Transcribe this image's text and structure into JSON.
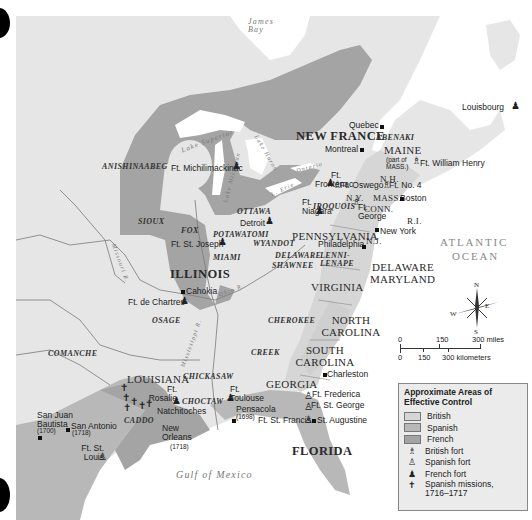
{
  "map": {
    "title": "Approximate Areas of Effective Control (c. 1716–1717)",
    "colors": {
      "background_land": "#e6e6e6",
      "water": "#ffffff",
      "british": "#d6d6d6",
      "spanish": "#b8b8b8",
      "french": "#a4a4a4",
      "border": "#777777"
    },
    "colonies": {
      "new_france": "NEW FRANCE",
      "maine": "MAINE",
      "maine_note": "(part of MASS.)",
      "nh": "N.H.",
      "ny": "N.Y.",
      "mass": "MASS.",
      "conn": "CONN.",
      "ri": "R.I.",
      "nj": "N.J.",
      "pennsylvania": "PENNSYLVANIA",
      "delaware": "DELAWARE",
      "maryland": "MARYLAND",
      "virginia": "VIRGINIA",
      "north_carolina": "NORTH CAROLINA",
      "south_carolina": "SOUTH CAROLINA",
      "georgia": "GEORGIA",
      "florida": "FLORIDA",
      "louisiana": "LOUISIANA",
      "illinois": "ILLINOIS"
    },
    "tribes": [
      "ANISHINAABEG",
      "SIOUX",
      "FOX",
      "POTAWATOMI",
      "OTTAWA",
      "IROQUOIS",
      "ABENAKI",
      "WYANDOT",
      "MIAMI",
      "DELAWARE",
      "SHAWNEE",
      "LENNI-LENAPE",
      "OSAGE",
      "CHEROKEE",
      "CREEK",
      "COMANCHE",
      "CHICKASAW",
      "CHOCTAW",
      "CADDO"
    ],
    "water": {
      "james_bay": "James Bay",
      "lake_superior": "Lake Superior",
      "lake_michigan": "Lake Michigan",
      "lake_huron": "Lake Huron",
      "lake_erie": "L. Erie",
      "lake_ontario": "Ontario",
      "atlantic_1": "ATLANTIC",
      "atlantic_2": "OCEAN",
      "gulf": "Gulf of Mexico",
      "missouri_r": "Missouri R.",
      "mississippi_r": "Mississippi R.",
      "ohio_r": "Ohio R.",
      "st_lawrence_r": "St. Lawrence R."
    },
    "places": {
      "quebec": "Quebec",
      "montreal": "Montreal",
      "louisbourg": "Louisbourg",
      "ft_william_henry": "Ft. William Henry",
      "ft_frontenac": "Ft. Frontenac",
      "ft_oswego": "Ft. Oswego",
      "ft_no4": "Ft. No. 4",
      "boston": "Boston",
      "ft_niagara": "Ft. Niagara",
      "ft_george": "Ft. George",
      "new_york": "New York",
      "philadelphia": "Philadelphia",
      "ft_michilimackinac": "Ft. Michilimackinac",
      "detroit": "Detroit",
      "ft_st_joseph": "Ft. St. Joseph",
      "cahokia": "Cahokia",
      "ft_de_chartres": "Ft. de Chartres",
      "charleston": "Charleston",
      "ft_frederica": "Ft. Frederica",
      "ft_st_george": "Ft. St. George",
      "ft_st_francis": "Ft. St. Francis",
      "st_augustine": "St. Augustine",
      "pensacola": "Pensacola",
      "pensacola_year": "(1698)",
      "ft_toulouse": "Ft. Toulouse",
      "ft_rosalie": "Ft. Rosalie",
      "natchitoches": "Natchitoches",
      "new_orleans": "New Orleans",
      "new_orleans_year": "(1718)",
      "san_juan_bautista": "San Juan Bautista",
      "san_juan_bautista_year": "(1700)",
      "san_antonio": "San Antonio",
      "san_antonio_year": "(1718)",
      "ft_st_louis": "Ft. St. Louis"
    },
    "compass": {
      "n": "N",
      "s": "S",
      "e": "E",
      "w": "W"
    },
    "scale": {
      "miles": [
        "0",
        "150",
        "300 miles"
      ],
      "km": [
        "0",
        "150",
        "300 kilometers"
      ]
    }
  },
  "legend": {
    "title": "Approximate Areas of Effective Control",
    "items": [
      {
        "label": "British",
        "type": "area",
        "color": "#d6d6d6"
      },
      {
        "label": "Spanish",
        "type": "area",
        "color": "#b8b8b8"
      },
      {
        "label": "French",
        "type": "area",
        "color": "#a4a4a4"
      },
      {
        "label": "British fort",
        "type": "symbol",
        "icon": "british-fort-icon",
        "glyph": "♗"
      },
      {
        "label": "Spanish fort",
        "type": "symbol",
        "icon": "spanish-fort-icon",
        "glyph": "♙"
      },
      {
        "label": "French fort",
        "type": "symbol",
        "icon": "french-fort-icon",
        "glyph": "♟"
      },
      {
        "label": "Spanish missions, 1716–1717",
        "type": "symbol",
        "icon": "mission-cross-icon",
        "glyph": "✝"
      }
    ]
  }
}
